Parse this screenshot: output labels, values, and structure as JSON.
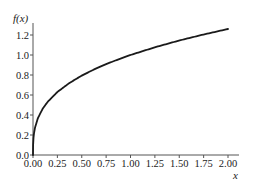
{
  "chart_data": {
    "type": "line",
    "title": "",
    "xlabel": "x",
    "ylabel": "f(x)",
    "function": "f(x) = x^(1/3)",
    "xlim": [
      0,
      2.0
    ],
    "ylim": [
      0,
      1.26
    ],
    "grid": false,
    "legend": null,
    "x_ticks": [
      0.0,
      0.25,
      0.5,
      0.75,
      1.0,
      1.25,
      1.5,
      1.75,
      2.0
    ],
    "x_tick_labels": [
      "0.00",
      "0.25",
      "0.50",
      "0.75",
      "1.00",
      "1.25",
      "1.50",
      "1.75",
      "2.00"
    ],
    "y_ticks": [
      0.0,
      0.2,
      0.4,
      0.6,
      0.8,
      1.0,
      1.2
    ],
    "y_tick_labels": [
      "0.0",
      "0.2",
      "0.4",
      "0.6",
      "0.8",
      "1.0",
      "1.2"
    ],
    "series": [
      {
        "name": "f(x)",
        "color": "#1a1a1a",
        "x": [
          0.0,
          0.001,
          0.005,
          0.01,
          0.02,
          0.05,
          0.1,
          0.15,
          0.25,
          0.375,
          0.5,
          0.625,
          0.75,
          0.875,
          1.0,
          1.25,
          1.5,
          1.75,
          2.0
        ],
        "y": [
          0.0,
          0.1,
          0.171,
          0.215,
          0.271,
          0.368,
          0.464,
          0.531,
          0.63,
          0.721,
          0.794,
          0.855,
          0.909,
          0.956,
          1.0,
          1.077,
          1.145,
          1.205,
          1.26
        ]
      }
    ]
  },
  "colors": {
    "axis": "#555555",
    "line": "#1a1a1a",
    "text": "#222222",
    "background": "#ffffff"
  }
}
